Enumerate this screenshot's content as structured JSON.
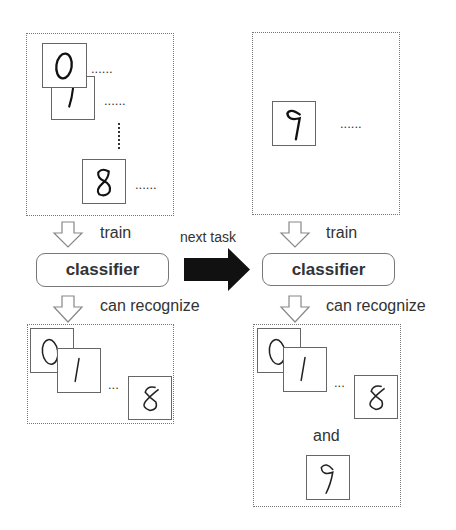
{
  "left_panel": {
    "top_box": {
      "digits": [
        "0",
        "1",
        "8"
      ],
      "ellipsis": "......"
    },
    "train_label": "train",
    "classifier_label": "classifier",
    "recognize_label": "can recognize",
    "bottom_box": {
      "digits": [
        "0",
        "1",
        "8"
      ],
      "ellipsis": "..."
    }
  },
  "transition": {
    "label": "next task",
    "arrow": "right-arrow"
  },
  "right_panel": {
    "top_box": {
      "digits": [
        "9"
      ],
      "ellipsis": "......"
    },
    "train_label": "train",
    "classifier_label": "classifier",
    "recognize_label": "can recognize",
    "bottom_box": {
      "digits": [
        "0",
        "1",
        "8"
      ],
      "ellipsis": "...",
      "conjunction": "and",
      "extra_digit": "9"
    }
  },
  "colors": {
    "border": "#777777",
    "text": "#333333",
    "arrow_fill": "#111111"
  }
}
